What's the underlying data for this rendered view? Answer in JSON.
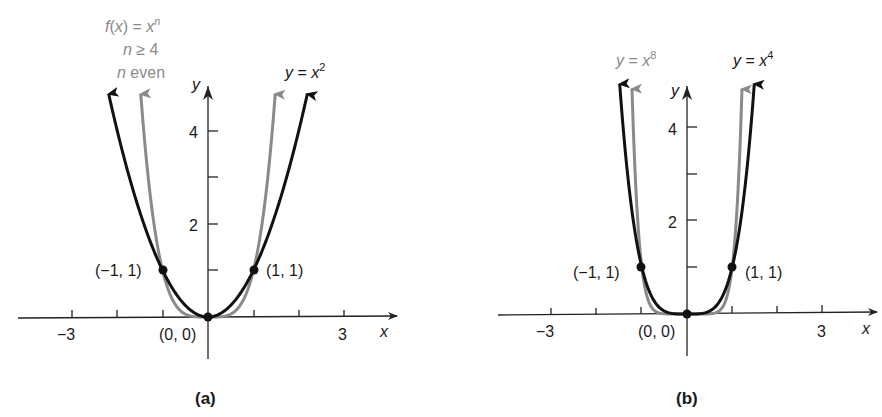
{
  "chart_data": [
    {
      "type": "line",
      "panel": "(a)",
      "caption": "(a)",
      "xlabel": "x",
      "ylabel": "y",
      "x_ticks": [
        -3,
        -2,
        -1,
        0,
        1,
        2,
        3
      ],
      "x_tick_labels": [
        "-3",
        "3"
      ],
      "y_ticks": [
        1,
        2,
        3,
        4
      ],
      "y_tick_labels": [
        "2",
        "4"
      ],
      "xlim": [
        -4.3,
        4.1
      ],
      "ylim": [
        -0.9,
        5
      ],
      "series": [
        {
          "name": "y = x^2",
          "label": "y = x²",
          "color": "#111111",
          "exponent": 2
        },
        {
          "name": "f(x) = x^n, n ≥ 4, n even",
          "label_lines": [
            "f(x) = xⁿ",
            "n ≥ 4",
            "n even"
          ],
          "color": "#8a8a8a",
          "exponent": 4
        }
      ],
      "points": [
        {
          "x": -1,
          "y": 1,
          "label": "(−1, 1)"
        },
        {
          "x": 0,
          "y": 0,
          "label": "(0, 0)"
        },
        {
          "x": 1,
          "y": 1,
          "label": "(1, 1)"
        }
      ],
      "grid": false,
      "legend": "inline annotations"
    },
    {
      "type": "line",
      "panel": "(b)",
      "caption": "(b)",
      "xlabel": "x",
      "ylabel": "y",
      "x_ticks": [
        -3,
        -2,
        -1,
        0,
        1,
        2,
        3
      ],
      "x_tick_labels": [
        "-3",
        "3"
      ],
      "y_ticks": [
        1,
        2,
        3,
        4
      ],
      "y_tick_labels": [
        "2",
        "4"
      ],
      "xlim": [
        -4.1,
        4.2
      ],
      "ylim": [
        -0.9,
        5
      ],
      "series": [
        {
          "name": "y = x^4",
          "label": "y = x⁴",
          "color": "#111111",
          "exponent": 4
        },
        {
          "name": "y = x^8",
          "label": "y = x⁸",
          "color": "#8a8a8a",
          "exponent": 8
        }
      ],
      "points": [
        {
          "x": -1,
          "y": 1,
          "label": "(−1, 1)"
        },
        {
          "x": 0,
          "y": 0,
          "label": "(0, 0)"
        },
        {
          "x": 1,
          "y": 1,
          "label": "(1, 1)"
        }
      ],
      "grid": false,
      "legend": "inline annotations"
    }
  ],
  "panels": {
    "a": {
      "caption": "(a)",
      "x_axis_label": "x",
      "y_axis_label": "y",
      "tick_neg3": "−3",
      "tick_3": "3",
      "tick_2": "2",
      "tick_4": "4",
      "family_label_1": "f(x) = x",
      "family_label_1_sup": "n",
      "family_label_2": "n ≥ 4",
      "family_label_3_n": "n",
      "family_label_3_rest": " even",
      "curve_label": "y = x",
      "curve_label_sup": "2",
      "point_left": "(−1, 1)",
      "point_origin": "(0, 0)",
      "point_right": "(1, 1)"
    },
    "b": {
      "caption": "(b)",
      "x_axis_label": "x",
      "y_axis_label": "y",
      "tick_neg3": "−3",
      "tick_3": "3",
      "tick_2": "2",
      "tick_4": "4",
      "gray_label": "y = x",
      "gray_label_sup": "8",
      "black_label": "y = x",
      "black_label_sup": "4",
      "point_left": "(−1, 1)",
      "point_origin": "(0, 0)",
      "point_right": "(1, 1)"
    }
  },
  "colors": {
    "black_curve": "#111111",
    "gray_curve": "#8a8a8a",
    "axis": "#222222"
  }
}
